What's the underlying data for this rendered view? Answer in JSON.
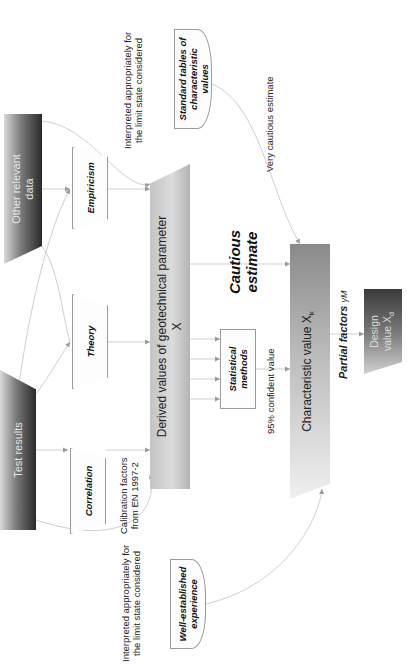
{
  "diagram": {
    "orientation": "rotated -90deg",
    "nodes": {
      "test_results": "Test results",
      "other_relevant_data": "Other relevant data",
      "correlation": "Correlation",
      "theory": "Theory",
      "empiricism": "Empiricism",
      "standard_tables": "Standard tables of characteristic values",
      "well_established_experience": "Well-established experience",
      "derived_values": "Derived values of geotechnical parameter",
      "derived_values_symbol": "X",
      "statistical_methods": "Statistical methods",
      "characteristic_value": "Characteristic value X",
      "characteristic_value_sub": "k",
      "design_value_line1": "Design",
      "design_value_line2": "value X",
      "design_value_sub": "d"
    },
    "labels": {
      "interpreted_top_line1": "Interpreted appropriately for",
      "interpreted_top_line2": "the limit state considered",
      "interpreted_bottom_line1": "Interpreted appropriately for",
      "interpreted_bottom_line2": "the limit state considered",
      "calibration_line1": "Calibration factors",
      "calibration_line2": "from EN 1997-2",
      "very_cautious": "Very cautious estimate",
      "confident_value": "95% confident value",
      "cautious_line1": "Cautious",
      "cautious_line2": "estimate",
      "partial_factors": "Partial factors",
      "partial_factors_symbol": "γM"
    },
    "colors": {
      "link": "#c8c8c8",
      "arrow": "#9a9a9a",
      "box_border": "#9a9a9a"
    }
  }
}
